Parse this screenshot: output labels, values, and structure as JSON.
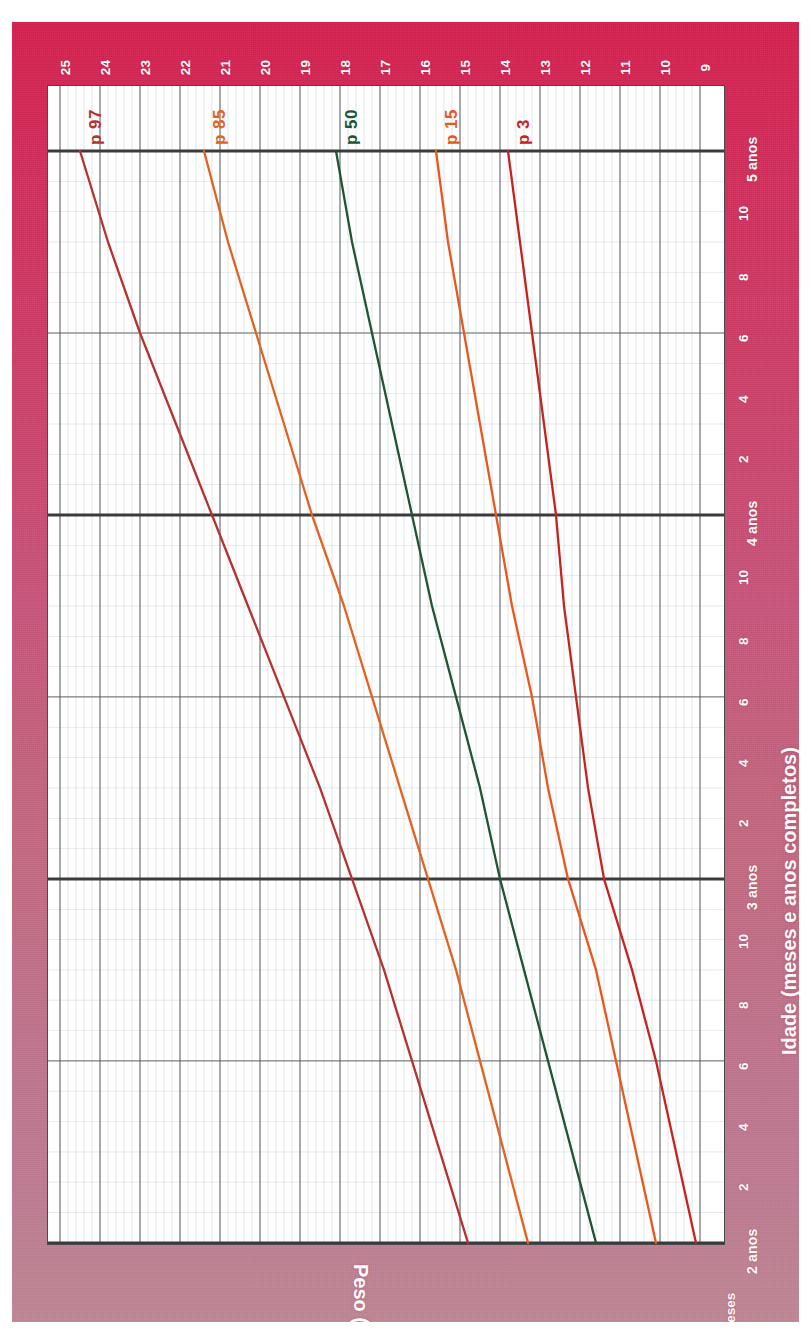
{
  "chart_data": {
    "type": "line",
    "title": "",
    "orientation": "rotated-90",
    "xlabel": "Idade (meses e anos completos)",
    "ylabel": "Peso (kg)",
    "x_unit_label": "Meses",
    "xlim": [
      24,
      60
    ],
    "ylim": [
      9,
      25
    ],
    "grid": true,
    "legend_position": "inline-at-curve-ends",
    "x_major_ticks": [
      {
        "value": 24,
        "label": "2 anos"
      },
      {
        "value": 36,
        "label": "3 anos"
      },
      {
        "value": 48,
        "label": "4 anos"
      },
      {
        "value": 60,
        "label": "5 anos"
      }
    ],
    "x_minor_ticks": [
      {
        "value": 26,
        "label": "2"
      },
      {
        "value": 28,
        "label": "4"
      },
      {
        "value": 30,
        "label": "6"
      },
      {
        "value": 32,
        "label": "8"
      },
      {
        "value": 34,
        "label": "10"
      },
      {
        "value": 38,
        "label": "2"
      },
      {
        "value": 40,
        "label": "4"
      },
      {
        "value": 42,
        "label": "6"
      },
      {
        "value": 44,
        "label": "8"
      },
      {
        "value": 46,
        "label": "10"
      },
      {
        "value": 50,
        "label": "2"
      },
      {
        "value": 52,
        "label": "4"
      },
      {
        "value": 54,
        "label": "6"
      },
      {
        "value": 56,
        "label": "8"
      },
      {
        "value": 58,
        "label": "10"
      }
    ],
    "y_ticks": [
      25,
      24,
      23,
      22,
      21,
      20,
      19,
      18,
      17,
      16,
      15,
      14,
      13,
      12,
      11,
      10,
      9
    ],
    "y_tick_labels": [
      "25",
      "24",
      "23",
      "22",
      "21",
      "20",
      "19",
      "18",
      "17",
      "16",
      "15",
      "14",
      "13",
      "12",
      "11",
      "10",
      "9"
    ],
    "x": [
      24,
      27,
      30,
      33,
      36,
      39,
      42,
      45,
      48,
      51,
      54,
      57,
      60
    ],
    "series": [
      {
        "name": "p 97",
        "label": "p 97",
        "color": "#b5332e",
        "values": [
          14.8,
          15.5,
          16.2,
          16.9,
          17.7,
          18.5,
          19.4,
          20.3,
          21.2,
          22.1,
          23.0,
          23.8,
          24.5
        ]
      },
      {
        "name": "p 85",
        "label": "p 85",
        "color": "#e0631f",
        "values": [
          13.3,
          13.9,
          14.5,
          15.1,
          15.8,
          16.5,
          17.2,
          17.9,
          18.7,
          19.4,
          20.1,
          20.8,
          21.4
        ]
      },
      {
        "name": "p 50",
        "label": "p 50",
        "color": "#1e5532",
        "values": [
          11.6,
          12.2,
          12.8,
          13.4,
          14.0,
          14.5,
          15.1,
          15.7,
          16.2,
          16.7,
          17.2,
          17.7,
          18.1
        ]
      },
      {
        "name": "p 15",
        "label": "p 15",
        "color": "#e8581c",
        "values": [
          10.1,
          10.6,
          11.1,
          11.6,
          12.3,
          12.8,
          13.2,
          13.7,
          14.1,
          14.5,
          14.9,
          15.3,
          15.6
        ]
      },
      {
        "name": "p 3",
        "label": "p 3",
        "color": "#c4231f",
        "values": [
          9.1,
          9.6,
          10.1,
          10.7,
          11.4,
          11.8,
          12.1,
          12.4,
          12.6,
          12.9,
          13.2,
          13.5,
          13.8
        ]
      }
    ]
  },
  "axes": {
    "y_title": "Peso (kg)",
    "x_title": "Idade (meses e anos completos)",
    "months_label": "Meses"
  },
  "colors": {
    "background_top": "#d6204f",
    "background_bottom": "#c08795",
    "plot_background": "#ffffff",
    "grid_major": "#5a5a5a",
    "grid_minor": "#b9c2cc",
    "axis_line": "#3b3b3b",
    "tick_text": "#ffffff"
  }
}
